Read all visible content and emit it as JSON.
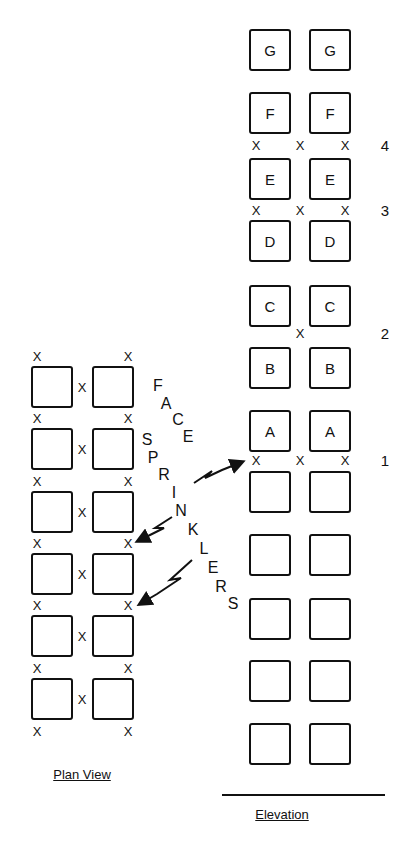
{
  "elevation": {
    "caption": "Elevation",
    "rows": [
      {
        "label": "G",
        "top": 29
      },
      {
        "label": "F",
        "top": 92
      },
      {
        "label": "E",
        "top": 158
      },
      {
        "label": "D",
        "top": 220
      },
      {
        "label": "C",
        "top": 285
      },
      {
        "label": "B",
        "top": 347
      },
      {
        "label": "A",
        "top": 410
      },
      {
        "label": "",
        "top": 471
      },
      {
        "label": "",
        "top": 534
      },
      {
        "label": "",
        "top": 598
      },
      {
        "label": "",
        "top": 660
      },
      {
        "label": "",
        "top": 723
      }
    ],
    "sprinkler_levels": [
      {
        "number": "4",
        "y": 145,
        "marks": [
          "left",
          "center",
          "right"
        ]
      },
      {
        "number": "3",
        "y": 210,
        "marks": [
          "left",
          "center",
          "right"
        ]
      },
      {
        "number": "2",
        "y": 333,
        "marks": [
          "center"
        ]
      },
      {
        "number": "1",
        "y": 460,
        "marks": [
          "left",
          "center",
          "right"
        ]
      }
    ],
    "sprinkler_mark": "X"
  },
  "plan_view": {
    "caption": "Plan View",
    "row_tops": [
      366,
      428,
      491,
      553,
      615,
      678
    ],
    "sprinkler_mark": "X"
  },
  "annotation": {
    "word1": "FACE",
    "word2": "SPRINKLERS"
  }
}
